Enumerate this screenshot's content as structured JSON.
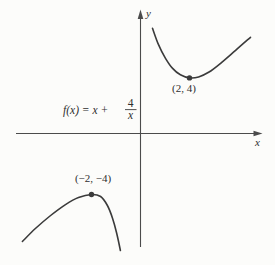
{
  "figure": {
    "background_color": "#fcfcfa",
    "ink_color": "#3b3b3b",
    "axis_color": "#4b4b4b"
  },
  "formula": {
    "prefix": "f(x) = x +",
    "numerator": "4",
    "denominator": "x",
    "full_text": "f(x) = x + 4/x"
  },
  "chart_data": {
    "type": "line",
    "title": "",
    "function_label": "f(x) = x + 4/x",
    "axes": {
      "x_label": "x",
      "y_label": "y",
      "grid": false,
      "ticks": "none",
      "xlim": [
        -5.1,
        5
      ],
      "ylim": [
        -7.4,
        8.9
      ]
    },
    "marked_points": [
      {
        "x": 2,
        "y": 4,
        "label": "(2, 4)",
        "kind": "local minimum"
      },
      {
        "x": -2,
        "y": -4,
        "label": "(−2, −4)",
        "kind": "local maximum"
      }
    ],
    "series": [
      {
        "name": "branch x > 0",
        "points": [
          [
            0.49,
            7.57
          ],
          [
            0.73,
            6.41
          ],
          [
            1.02,
            5.41
          ],
          [
            1.31,
            4.68
          ],
          [
            1.63,
            4.22
          ],
          [
            2,
            4
          ],
          [
            2.37,
            4.07
          ],
          [
            2.78,
            4.4
          ],
          [
            3.27,
            5.05
          ],
          [
            3.88,
            5.98
          ],
          [
            4.49,
            6.92
          ]
        ]
      },
      {
        "name": "branch x < 0",
        "points": [
          [
            -4.82,
            -7.08
          ],
          [
            -4.29,
            -6.23
          ],
          [
            -3.67,
            -5.38
          ],
          [
            -3.06,
            -4.66
          ],
          [
            -2.53,
            -4.2
          ],
          [
            -2,
            -4
          ],
          [
            -1.63,
            -4.13
          ],
          [
            -1.35,
            -4.72
          ],
          [
            -1.14,
            -5.57
          ],
          [
            -0.98,
            -6.49
          ],
          [
            -0.82,
            -7.67
          ]
        ]
      }
    ]
  }
}
